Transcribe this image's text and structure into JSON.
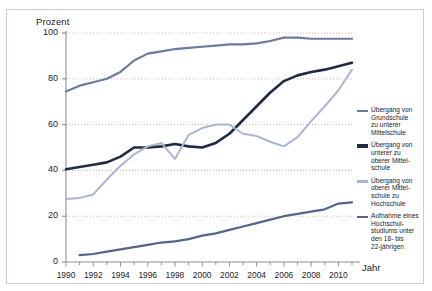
{
  "axes": {
    "ylabel": "Prozent",
    "xlabel": "Jahr",
    "yticks": [
      "0",
      "20",
      "40",
      "60",
      "80",
      "100"
    ],
    "xticks": [
      "1990",
      "1992",
      "1994",
      "1996",
      "1998",
      "2000",
      "2002",
      "2004",
      "2006",
      "2008",
      "2010"
    ]
  },
  "legend": {
    "items": [
      {
        "label": "Übergang von\nGrundschule\nzu unterer\nMittelschule",
        "color": "#6b7a9e"
      },
      {
        "label": "Übergang von\nunterer zu\noberer Mittel-\nschule",
        "color": "#222b45"
      },
      {
        "label": "Übergang von\noberer Mittel-\nschule zu\nHochschule",
        "color": "#a9b6d2"
      },
      {
        "label": "Aufnahme eines\nHochschul-\nstudiums unter\nden 18- bis\n22-jährigen",
        "color": "#55648c"
      }
    ]
  },
  "chart_data": {
    "type": "line",
    "title": "",
    "xlabel": "Jahr",
    "ylabel": "Prozent",
    "xlim": [
      1990,
      2011
    ],
    "ylim": [
      0,
      100
    ],
    "grid": true,
    "legend_position": "right",
    "x": [
      1990,
      1991,
      1992,
      1993,
      1994,
      1995,
      1996,
      1997,
      1998,
      1999,
      2000,
      2001,
      2002,
      2003,
      2004,
      2005,
      2006,
      2007,
      2008,
      2009,
      2010,
      2011
    ],
    "series": [
      {
        "name": "Übergang von Grundschule zu unterer Mittelschule",
        "color": "#6b7a9e",
        "width": 2.2,
        "values": [
          74.5,
          77,
          78.5,
          80,
          83,
          88,
          91,
          92,
          93,
          93.5,
          94,
          94.5,
          95,
          95,
          95.5,
          96.5,
          98,
          98,
          97.5,
          97.5,
          97.5,
          97.5
        ]
      },
      {
        "name": "Übergang von unterer zu oberer Mittelschule",
        "color": "#222b45",
        "width": 2.6,
        "values": [
          40.5,
          41.5,
          42.5,
          43.5,
          46,
          50,
          50,
          50.5,
          51.5,
          50.5,
          50,
          52,
          56,
          62,
          68,
          74,
          79,
          81.5,
          83,
          84,
          85.5,
          87
        ]
      },
      {
        "name": "Übergang von oberer Mittelschule zu Hochschule",
        "color": "#a9b6d2",
        "width": 2.0,
        "values": [
          27.5,
          28,
          29.5,
          36,
          42,
          47,
          50.5,
          52,
          45,
          55.5,
          58.5,
          60,
          60,
          56,
          55,
          52.5,
          50.5,
          54.5,
          61.5,
          68,
          75,
          84
        ]
      },
      {
        "name": "Aufnahme eines Hochschulstudiums unter den 18- bis 22-jährigen",
        "color": "#55648c",
        "width": 2.2,
        "values": [
          null,
          3,
          3.5,
          4.5,
          5.5,
          6.5,
          7.5,
          8.5,
          9,
          10,
          11.5,
          12.5,
          14,
          15.5,
          17,
          18.5,
          20,
          21,
          22,
          23,
          25.5,
          26
        ]
      }
    ]
  }
}
